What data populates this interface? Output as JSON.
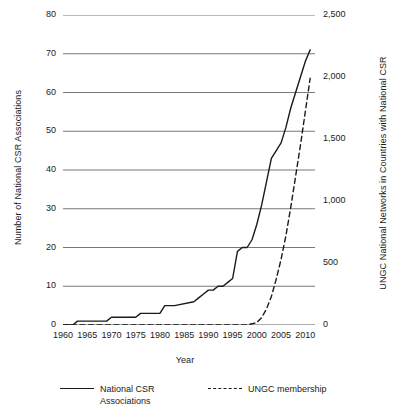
{
  "chart_data": {
    "type": "line",
    "title": "",
    "xlabel": "Year",
    "ylabel": "Number of National CSR Associations",
    "ylabel_right": "UNGC National Networks in Countries with National CSR",
    "xlim": [
      1960,
      2012
    ],
    "ylim": [
      0,
      80
    ],
    "ylim_right": [
      0,
      2500
    ],
    "grid": true,
    "legend_position": "bottom",
    "xticks": [
      "1960",
      "1965",
      "1970",
      "1975",
      "1980",
      "1985",
      "1990",
      "1995",
      "2000",
      "2005",
      "2010"
    ],
    "xtick_values": [
      1960,
      1965,
      1970,
      1975,
      1980,
      1985,
      1990,
      1995,
      2000,
      2005,
      2010
    ],
    "yticks_left": [
      "0",
      "10",
      "20",
      "30",
      "40",
      "50",
      "60",
      "70",
      "80"
    ],
    "ytick_values_left": [
      0,
      10,
      20,
      30,
      40,
      50,
      60,
      70,
      80
    ],
    "yticks_right": [
      "0",
      "500",
      "1,000",
      "1,500",
      "2,000",
      "2,500"
    ],
    "ytick_values_right": [
      0,
      500,
      1000,
      1500,
      2000,
      2500
    ],
    "series": [
      {
        "name": "National CSR Associations",
        "style": "solid",
        "axis": "left",
        "color": "#1a1a1a",
        "x": [
          1960,
          1962,
          1963,
          1964,
          1969,
          1970,
          1971,
          1975,
          1976,
          1979,
          1980,
          1981,
          1982,
          1983,
          1987,
          1988,
          1989,
          1990,
          1991,
          1992,
          1993,
          1994,
          1995,
          1996,
          1997,
          1998,
          1999,
          2000,
          2001,
          2002,
          2003,
          2004,
          2005,
          2006,
          2007,
          2008,
          2009,
          2010,
          2011
        ],
        "y": [
          0,
          0,
          1,
          1,
          1,
          2,
          2,
          2,
          3,
          3,
          3,
          5,
          5,
          5,
          6,
          7,
          8,
          9,
          9,
          10,
          10,
          11,
          12,
          19,
          20,
          20,
          22,
          26,
          31,
          37,
          43,
          45,
          47,
          51,
          56,
          60,
          64,
          68,
          71
        ]
      },
      {
        "name": "UNGC membership",
        "style": "dashed",
        "axis": "right",
        "color": "#1a1a1a",
        "x": [
          1960,
          1998,
          2000,
          2001,
          2002,
          2003,
          2004,
          2005,
          2006,
          2007,
          2008,
          2009,
          2010,
          2011
        ],
        "y": [
          0,
          0,
          20,
          60,
          130,
          230,
          370,
          530,
          720,
          950,
          1200,
          1450,
          1720,
          1990
        ]
      }
    ],
    "legend": [
      {
        "label": "National CSR\nAssociations",
        "style": "solid"
      },
      {
        "label": "UNGC membership",
        "style": "dashed"
      }
    ]
  }
}
